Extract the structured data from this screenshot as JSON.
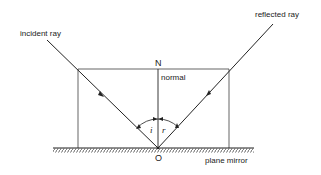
{
  "diagram": {
    "labels": {
      "incident_ray": "incident ray",
      "reflected_ray": "reflected ray",
      "normal_point": "N",
      "normal": "normal",
      "point_of_incidence": "O",
      "mirror": "plane mirror",
      "angle_incidence": "i",
      "angle_reflection": "r"
    },
    "colors": {
      "line": "#222222",
      "background": "#ffffff"
    }
  }
}
